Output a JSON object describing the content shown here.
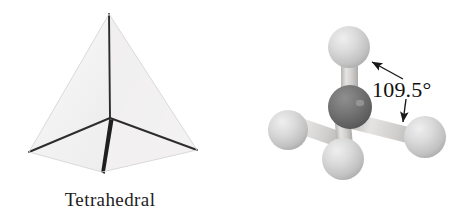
{
  "figure": {
    "background_color": "#ffffff",
    "width": 470,
    "height": 216
  },
  "left_panel": {
    "name": "tetrahedron-geometry-diagram",
    "caption": "Tetrahedral",
    "shape": "tetrahedron",
    "face_fill_left": "#eceaea",
    "face_fill_right": "#e2e0e0",
    "face_fill_front": "#f6f5f5",
    "edge_color": "#2a2a2a",
    "vertices": {
      "apex": [
        109,
        14
      ],
      "back_left": [
        29,
        152
      ],
      "back_right": [
        197,
        150
      ],
      "front_bottom": [
        102,
        172
      ],
      "center_junction": [
        110,
        118
      ]
    }
  },
  "right_panel": {
    "name": "methane-ball-and-stick-model",
    "angle_label": "109.5°",
    "central_atom": {
      "label": "carbon",
      "color": "#6b6b6b",
      "highlight": "#8d8d8d",
      "cx": 350,
      "cy": 107,
      "r": 22
    },
    "outer_atoms": [
      {
        "label": "hydrogen-top",
        "color": "#cdcdcd",
        "cx": 349,
        "cy": 47,
        "r": 21
      },
      {
        "label": "hydrogen-left",
        "color": "#cdcdcd",
        "cx": 288,
        "cy": 130,
        "r": 20
      },
      {
        "label": "hydrogen-bottom",
        "color": "#cdcdcd",
        "cx": 343,
        "cy": 159,
        "r": 21
      },
      {
        "label": "hydrogen-right",
        "color": "#cdcdcd",
        "cx": 425,
        "cy": 137,
        "r": 21
      }
    ],
    "bond_color": "#d2d0ce",
    "arrows": [
      {
        "label": "arrow-to-top-bond",
        "from": [
          403,
          79
        ],
        "to": [
          371,
          62
        ]
      },
      {
        "label": "arrow-to-right-bond",
        "from": [
          406,
          99
        ],
        "to": [
          403,
          124
        ]
      }
    ],
    "arrow_color": "#1a1a1a"
  }
}
